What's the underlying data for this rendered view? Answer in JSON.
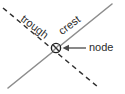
{
  "figure": {
    "background_color": "#ffffff",
    "width": 125,
    "height": 94
  },
  "labels": {
    "trough": "trough",
    "crest": "crest",
    "node": "node"
  },
  "icons": {
    "node_marker": "circled-x-icon",
    "pointer": "arrow-left-icon"
  },
  "colors": {
    "crest_line": "#8d8d8d",
    "trough_line": "#2f2f2f",
    "text": "#2b2b2b",
    "arrow": "#4a4a4a",
    "node_marker": "#1f1f1f"
  },
  "geometry": {
    "node_center": {
      "x": 56,
      "y": 48
    },
    "node_radius": 4.5,
    "crest_line": {
      "x1": 8,
      "y1": 88,
      "x2": 112,
      "y2": 4,
      "style": "solid"
    },
    "trough_line": {
      "x1": 3,
      "y1": 8,
      "x2": 98,
      "y2": 87,
      "style": "dashed"
    },
    "arrow": {
      "x1": 86,
      "y1": 48,
      "x2": 64,
      "y2": 48,
      "direction": "left"
    }
  }
}
